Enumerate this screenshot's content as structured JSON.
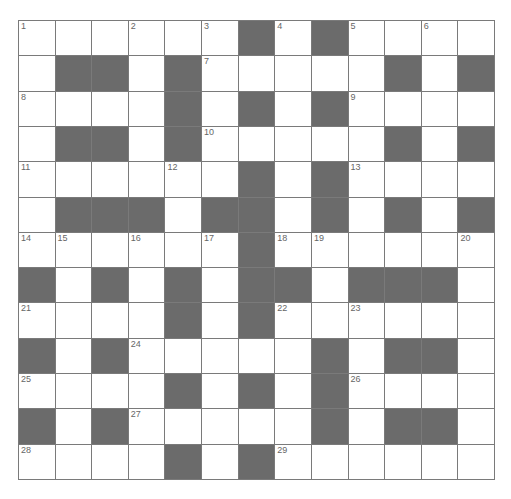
{
  "puzzle": {
    "rows": 13,
    "cols": 13,
    "colors": {
      "black_cell": "#6b6b6b",
      "white_cell": "#ffffff",
      "grid_line": "#7a7a7a",
      "number_text": "#666666"
    },
    "grid": [
      [
        "1",
        "W",
        "W",
        "2",
        "W",
        "3",
        "B",
        "4",
        "B",
        "5",
        "W",
        "6",
        "W"
      ],
      [
        "W",
        "B",
        "B",
        "W",
        "B",
        "7",
        "W",
        "W",
        "W",
        "W",
        "B",
        "W",
        "B"
      ],
      [
        "8",
        "W",
        "W",
        "W",
        "B",
        "W",
        "B",
        "W",
        "B",
        "9",
        "W",
        "W",
        "W"
      ],
      [
        "W",
        "B",
        "B",
        "W",
        "B",
        "10",
        "W",
        "W",
        "W",
        "W",
        "B",
        "W",
        "B"
      ],
      [
        "11",
        "W",
        "W",
        "W",
        "12",
        "W",
        "B",
        "W",
        "B",
        "13",
        "W",
        "W",
        "W"
      ],
      [
        "W",
        "B",
        "B",
        "B",
        "W",
        "B",
        "B",
        "W",
        "B",
        "W",
        "B",
        "W",
        "B"
      ],
      [
        "14",
        "15",
        "W",
        "16",
        "W",
        "17",
        "B",
        "18",
        "19",
        "W",
        "W",
        "W",
        "20"
      ],
      [
        "B",
        "W",
        "B",
        "W",
        "B",
        "W",
        "B",
        "B",
        "W",
        "B",
        "B",
        "B",
        "W"
      ],
      [
        "21",
        "W",
        "W",
        "W",
        "B",
        "W",
        "B",
        "22",
        "W",
        "23",
        "W",
        "W",
        "W"
      ],
      [
        "B",
        "W",
        "B",
        "24",
        "W",
        "W",
        "W",
        "W",
        "B",
        "W",
        "B",
        "B",
        "W"
      ],
      [
        "25",
        "W",
        "W",
        "W",
        "B",
        "W",
        "B",
        "W",
        "B",
        "26",
        "W",
        "W",
        "W"
      ],
      [
        "B",
        "W",
        "B",
        "27",
        "W",
        "W",
        "W",
        "W",
        "B",
        "W",
        "B",
        "B",
        "W"
      ],
      [
        "28",
        "W",
        "W",
        "W",
        "B",
        "W",
        "B",
        "29",
        "W",
        "W",
        "W",
        "W",
        "W"
      ]
    ]
  }
}
